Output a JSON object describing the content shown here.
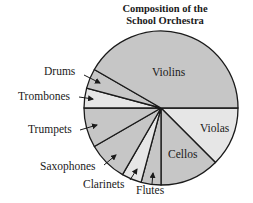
{
  "chart_data": {
    "type": "pie",
    "title": "Composition of the School Orchestra",
    "title_lines": [
      "Composition of the",
      "School Orchestra"
    ],
    "unit": "share of members (estimated from slice angles)",
    "start_angle_deg": 0,
    "direction": "clockwise",
    "slices": [
      {
        "label": "Violas",
        "value": 9,
        "percent": 12.5,
        "fill": "#e6e6e6",
        "label_pos": [
          200,
          132
        ],
        "label_inside": true
      },
      {
        "label": "Cellos",
        "value": 9,
        "percent": 12.5,
        "fill": "#c6c6c6",
        "label_pos": [
          168,
          158
        ],
        "label_inside": true
      },
      {
        "label": "Flutes",
        "value": 3,
        "percent": 4.17,
        "fill": "#c6c6c6",
        "label_pos": [
          136,
          194
        ],
        "label_inside": false,
        "arrow": [
          [
            152,
            184
          ],
          [
            153,
            173
          ]
        ]
      },
      {
        "label": "Clarinets",
        "value": 3,
        "percent": 4.17,
        "fill": "#e6e6e6",
        "label_pos": [
          83,
          188
        ],
        "label_inside": false,
        "arrow": [
          [
            130,
            180
          ],
          [
            137,
            169
          ]
        ]
      },
      {
        "label": "Saxophones",
        "value": 6,
        "percent": 8.33,
        "fill": "#c6c6c6",
        "label_pos": [
          40,
          170
        ],
        "label_inside": false,
        "arrow": [
          [
            104,
            165
          ],
          [
            116,
            155
          ]
        ]
      },
      {
        "label": "Trumpets",
        "value": 6,
        "percent": 8.33,
        "fill": "#c6c6c6",
        "label_pos": [
          28,
          133
        ],
        "label_inside": false,
        "arrow": [
          [
            80,
            130
          ],
          [
            97,
            125
          ]
        ]
      },
      {
        "label": "Trombones",
        "value": 3,
        "percent": 4.17,
        "fill": "#e6e6e6",
        "label_pos": [
          18,
          100
        ],
        "label_inside": false,
        "arrow": [
          [
            79,
            97
          ],
          [
            93,
            99
          ]
        ]
      },
      {
        "label": "Drums",
        "value": 3,
        "percent": 4.17,
        "fill": "#c6c6c6",
        "label_pos": [
          44,
          75
        ],
        "label_inside": false,
        "arrow": [
          [
            84,
            75
          ],
          [
            100,
            83
          ]
        ]
      },
      {
        "label": "Violins",
        "value": 30,
        "percent": 41.67,
        "fill": "#c6c6c6",
        "label_pos": [
          152,
          76
        ],
        "label_inside": true
      }
    ],
    "total": 72,
    "legend": "none (labels on/around slices)",
    "grid": false
  },
  "layout": {
    "center": [
      161,
      108
    ],
    "radius": 77,
    "stroke": "#1a1a1a"
  }
}
